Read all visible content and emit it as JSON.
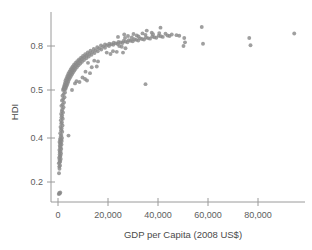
{
  "chart_data": {
    "type": "scatter",
    "title": "",
    "xlabel": "GDP per Capita (2008 US$)",
    "ylabel": "HDI",
    "xlim": [
      -3000,
      98000
    ],
    "ylim": [
      0.13,
      0.95
    ],
    "grid": false,
    "legend": null,
    "marker_color": "#8a8a8a",
    "axis_color": "#9a9a9a",
    "xticks": [
      0,
      20000,
      40000,
      60000,
      80000
    ],
    "xticklabels": [
      "0",
      "20,000",
      "40,000",
      "60,000",
      "80,000"
    ],
    "yticks": [
      0.2,
      0.4,
      0.5,
      0.8
    ],
    "yticklabels": [
      "0.2",
      "0.4",
      "0.5",
      "0.8"
    ],
    "points": [
      [
        300,
        0.145
      ],
      [
        500,
        0.15
      ],
      [
        700,
        0.148
      ],
      [
        900,
        0.152
      ],
      [
        400,
        0.24
      ],
      [
        600,
        0.26
      ],
      [
        500,
        0.27
      ],
      [
        800,
        0.275
      ],
      [
        350,
        0.285
      ],
      [
        700,
        0.29
      ],
      [
        900,
        0.295
      ],
      [
        600,
        0.3
      ],
      [
        1100,
        0.305
      ],
      [
        450,
        0.31
      ],
      [
        850,
        0.315
      ],
      [
        1000,
        0.32
      ],
      [
        650,
        0.325
      ],
      [
        1200,
        0.33
      ],
      [
        750,
        0.335
      ],
      [
        950,
        0.34
      ],
      [
        550,
        0.345
      ],
      [
        1300,
        0.35
      ],
      [
        800,
        0.355
      ],
      [
        1050,
        0.36
      ],
      [
        700,
        0.365
      ],
      [
        1400,
        0.37
      ],
      [
        900,
        0.375
      ],
      [
        1150,
        0.378
      ],
      [
        600,
        0.382
      ],
      [
        1500,
        0.386
      ],
      [
        1000,
        0.39
      ],
      [
        1250,
        0.393
      ],
      [
        800,
        0.396
      ],
      [
        1600,
        0.4
      ],
      [
        1100,
        0.403
      ],
      [
        1350,
        0.406
      ],
      [
        900,
        0.41
      ],
      [
        1700,
        0.413
      ],
      [
        1200,
        0.416
      ],
      [
        1450,
        0.42
      ],
      [
        1000,
        0.423
      ],
      [
        1800,
        0.426
      ],
      [
        1300,
        0.43
      ],
      [
        1550,
        0.433
      ],
      [
        4200,
        0.405
      ],
      [
        1150,
        0.437
      ],
      [
        1900,
        0.44
      ],
      [
        1400,
        0.443
      ],
      [
        1650,
        0.447
      ],
      [
        1250,
        0.45
      ],
      [
        2000,
        0.453
      ],
      [
        1500,
        0.456
      ],
      [
        1750,
        0.46
      ],
      [
        2200,
        0.464
      ],
      [
        1350,
        0.467
      ],
      [
        1850,
        0.47
      ],
      [
        2400,
        0.474
      ],
      [
        1600,
        0.478
      ],
      [
        2100,
        0.481
      ],
      [
        2600,
        0.485
      ],
      [
        1800,
        0.488
      ],
      [
        2300,
        0.492
      ],
      [
        2800,
        0.495
      ],
      [
        2000,
        0.5
      ],
      [
        2500,
        0.503
      ],
      [
        3000,
        0.507
      ],
      [
        5600,
        0.5
      ],
      [
        2200,
        0.51
      ],
      [
        2700,
        0.514
      ],
      [
        3200,
        0.518
      ],
      [
        2400,
        0.522
      ],
      [
        2900,
        0.526
      ],
      [
        3500,
        0.53
      ],
      [
        2600,
        0.534
      ],
      [
        3100,
        0.538
      ],
      [
        3800,
        0.542
      ],
      [
        6800,
        0.545
      ],
      [
        2800,
        0.548
      ],
      [
        3400,
        0.552
      ],
      [
        4100,
        0.556
      ],
      [
        7400,
        0.56
      ],
      [
        3000,
        0.564
      ],
      [
        3700,
        0.568
      ],
      [
        4400,
        0.572
      ],
      [
        3300,
        0.576
      ],
      [
        4000,
        0.58
      ],
      [
        4800,
        0.584
      ],
      [
        3600,
        0.588
      ],
      [
        4300,
        0.592
      ],
      [
        5200,
        0.596
      ],
      [
        3900,
        0.6
      ],
      [
        4700,
        0.604
      ],
      [
        5600,
        0.608
      ],
      [
        4200,
        0.612
      ],
      [
        5100,
        0.616
      ],
      [
        6000,
        0.62
      ],
      [
        4600,
        0.624
      ],
      [
        5500,
        0.628
      ],
      [
        6500,
        0.632
      ],
      [
        5000,
        0.636
      ],
      [
        5900,
        0.64
      ],
      [
        7000,
        0.644
      ],
      [
        5400,
        0.648
      ],
      [
        6400,
        0.652
      ],
      [
        7600,
        0.656
      ],
      [
        5900,
        0.66
      ],
      [
        6900,
        0.664
      ],
      [
        8200,
        0.668
      ],
      [
        6400,
        0.672
      ],
      [
        7500,
        0.676
      ],
      [
        8900,
        0.68
      ],
      [
        7000,
        0.684
      ],
      [
        8100,
        0.688
      ],
      [
        9600,
        0.692
      ],
      [
        7700,
        0.696
      ],
      [
        8800,
        0.7
      ],
      [
        10400,
        0.704
      ],
      [
        8400,
        0.708
      ],
      [
        9600,
        0.712
      ],
      [
        11300,
        0.716
      ],
      [
        9200,
        0.72
      ],
      [
        10500,
        0.724
      ],
      [
        12300,
        0.728
      ],
      [
        10000,
        0.732
      ],
      [
        11500,
        0.736
      ],
      [
        13400,
        0.74
      ],
      [
        10900,
        0.744
      ],
      [
        12600,
        0.748
      ],
      [
        14600,
        0.752
      ],
      [
        11900,
        0.756
      ],
      [
        13800,
        0.76
      ],
      [
        15900,
        0.764
      ],
      [
        13000,
        0.768
      ],
      [
        15100,
        0.772
      ],
      [
        17300,
        0.776
      ],
      [
        14300,
        0.78
      ],
      [
        16500,
        0.784
      ],
      [
        18800,
        0.788
      ],
      [
        15700,
        0.792
      ],
      [
        18000,
        0.796
      ],
      [
        20400,
        0.8
      ],
      [
        17200,
        0.804
      ],
      [
        19600,
        0.806
      ],
      [
        22100,
        0.808
      ],
      [
        18800,
        0.81
      ],
      [
        21300,
        0.812
      ],
      [
        23900,
        0.814
      ],
      [
        20500,
        0.816
      ],
      [
        23100,
        0.818
      ],
      [
        25800,
        0.82
      ],
      [
        22300,
        0.822
      ],
      [
        25000,
        0.824
      ],
      [
        27800,
        0.826
      ],
      [
        24200,
        0.828
      ],
      [
        27000,
        0.83
      ],
      [
        29900,
        0.832
      ],
      [
        26200,
        0.834
      ],
      [
        29100,
        0.836
      ],
      [
        32100,
        0.838
      ],
      [
        28300,
        0.84
      ],
      [
        31300,
        0.842
      ],
      [
        34400,
        0.844
      ],
      [
        30500,
        0.846
      ],
      [
        33600,
        0.848
      ],
      [
        36800,
        0.85
      ],
      [
        32800,
        0.852
      ],
      [
        36000,
        0.854
      ],
      [
        39300,
        0.856
      ],
      [
        35200,
        0.858
      ],
      [
        38500,
        0.86
      ],
      [
        41900,
        0.862
      ],
      [
        37700,
        0.864
      ],
      [
        41100,
        0.866
      ],
      [
        44600,
        0.868
      ],
      [
        40300,
        0.87
      ],
      [
        43800,
        0.872
      ],
      [
        47400,
        0.874
      ],
      [
        26500,
        0.878
      ],
      [
        30200,
        0.882
      ],
      [
        33800,
        0.886
      ],
      [
        37500,
        0.89
      ],
      [
        28000,
        0.868
      ],
      [
        31500,
        0.872
      ],
      [
        35000,
        0.876
      ],
      [
        38000,
        0.88
      ],
      [
        24000,
        0.862
      ],
      [
        26800,
        0.855
      ],
      [
        29500,
        0.858
      ],
      [
        32200,
        0.865
      ],
      [
        40500,
        0.888
      ],
      [
        43000,
        0.884
      ],
      [
        45500,
        0.878
      ],
      [
        35500,
        0.905
      ],
      [
        41000,
        0.925
      ],
      [
        48500,
        0.87
      ],
      [
        50500,
        0.855
      ],
      [
        50800,
        0.825
      ],
      [
        50200,
        0.8
      ],
      [
        57500,
        0.93
      ],
      [
        58000,
        0.815
      ],
      [
        24500,
        0.8
      ],
      [
        25500,
        0.795
      ],
      [
        27000,
        0.785
      ],
      [
        22000,
        0.765
      ],
      [
        23500,
        0.76
      ],
      [
        26000,
        0.755
      ],
      [
        19500,
        0.755
      ],
      [
        21000,
        0.745
      ],
      [
        14500,
        0.7
      ],
      [
        16000,
        0.695
      ],
      [
        12000,
        0.685
      ],
      [
        13500,
        0.655
      ],
      [
        15500,
        0.66
      ],
      [
        11000,
        0.625
      ],
      [
        12800,
        0.615
      ],
      [
        9800,
        0.585
      ],
      [
        10800,
        0.575
      ],
      [
        8600,
        0.555
      ],
      [
        11600,
        0.565
      ],
      [
        35000,
        0.54
      ],
      [
        76500,
        0.855
      ],
      [
        77000,
        0.805
      ],
      [
        94500,
        0.885
      ]
    ]
  }
}
